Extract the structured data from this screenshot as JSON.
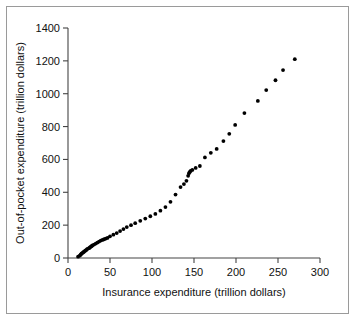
{
  "chart_data": {
    "type": "scatter",
    "title": "",
    "xlabel": "Insurance expenditure (trillion dollars)",
    "ylabel": "Out-of-pocket expenditure (trillion dollars)",
    "xlim": [
      0,
      300
    ],
    "ylim": [
      0,
      1400
    ],
    "xticks": [
      0,
      50,
      100,
      150,
      200,
      250,
      300
    ],
    "yticks": [
      0,
      200,
      400,
      600,
      800,
      1000,
      1200,
      1400
    ],
    "xtick_labels": [
      "0",
      "50",
      "100",
      "150",
      "200",
      "250",
      "300"
    ],
    "ytick_labels": [
      "0",
      "200",
      "400",
      "600",
      "800",
      "1000",
      "1200",
      "1400"
    ],
    "grid": false,
    "legend": false,
    "marker": "filled-circle",
    "marker_color": "#000000",
    "series": [
      {
        "name": "expenditure",
        "points": [
          [
            12,
            8
          ],
          [
            14,
            14
          ],
          [
            15,
            20
          ],
          [
            16,
            26
          ],
          [
            17,
            30
          ],
          [
            18,
            34
          ],
          [
            19,
            38
          ],
          [
            20,
            42
          ],
          [
            21,
            46
          ],
          [
            22,
            50
          ],
          [
            23,
            55
          ],
          [
            25,
            60
          ],
          [
            26,
            64
          ],
          [
            27,
            68
          ],
          [
            28,
            72
          ],
          [
            29,
            76
          ],
          [
            31,
            82
          ],
          [
            33,
            88
          ],
          [
            35,
            94
          ],
          [
            37,
            100
          ],
          [
            39,
            106
          ],
          [
            41,
            110
          ],
          [
            43,
            114
          ],
          [
            45,
            118
          ],
          [
            47,
            122
          ],
          [
            50,
            132
          ],
          [
            54,
            142
          ],
          [
            58,
            152
          ],
          [
            62,
            164
          ],
          [
            66,
            176
          ],
          [
            70,
            188
          ],
          [
            75,
            200
          ],
          [
            80,
            212
          ],
          [
            86,
            226
          ],
          [
            92,
            240
          ],
          [
            98,
            254
          ],
          [
            104,
            268
          ],
          [
            110,
            288
          ],
          [
            116,
            310
          ],
          [
            122,
            342
          ],
          [
            128,
            386
          ],
          [
            134,
            432
          ],
          [
            138,
            450
          ],
          [
            141,
            470
          ],
          [
            143,
            500
          ],
          [
            144,
            516
          ],
          [
            145,
            524
          ],
          [
            146,
            530
          ],
          [
            148,
            536
          ],
          [
            152,
            548
          ],
          [
            157,
            560
          ],
          [
            163,
            612
          ],
          [
            170,
            640
          ],
          [
            177,
            664
          ],
          [
            185,
            712
          ],
          [
            192,
            756
          ],
          [
            199,
            810
          ],
          [
            210,
            882
          ],
          [
            226,
            956
          ],
          [
            236,
            1022
          ],
          [
            247,
            1082
          ],
          [
            256,
            1144
          ],
          [
            270,
            1210
          ]
        ]
      }
    ]
  }
}
